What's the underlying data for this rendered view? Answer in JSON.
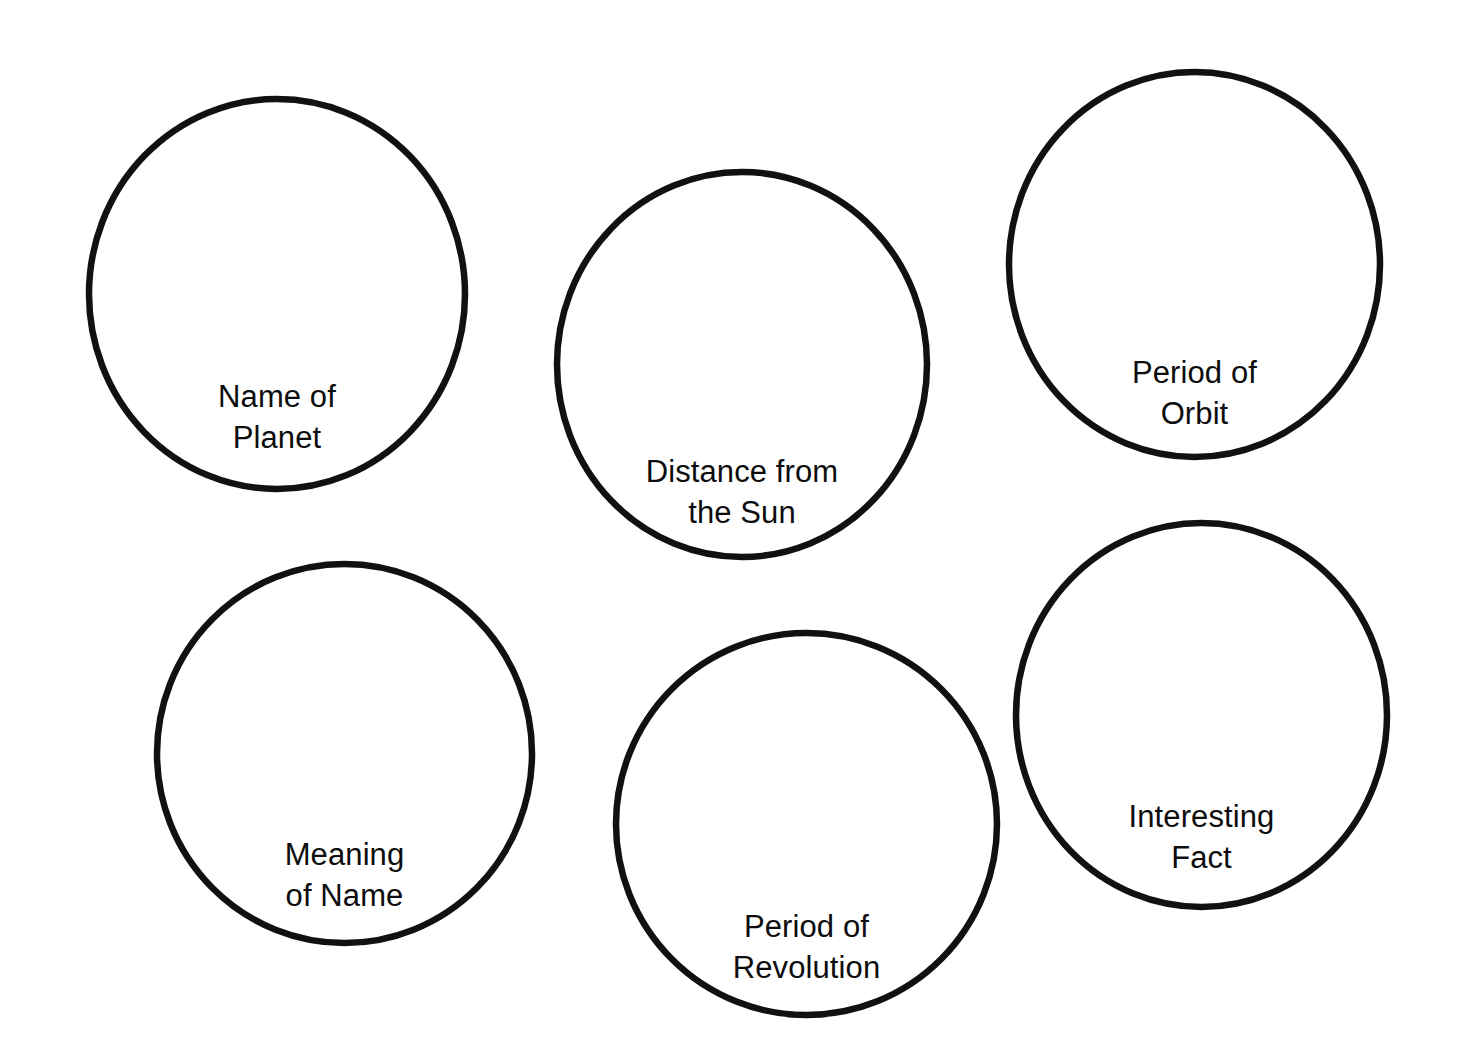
{
  "page": {
    "background_color": "#ffffff",
    "stroke_color": "#111111",
    "text_color": "#0d0d0d",
    "width": 1464,
    "height": 1061
  },
  "bubbles": [
    {
      "id": "name-of-planet",
      "label": "Name of\nPlanet",
      "line1": "Name of",
      "line2": "Planet"
    },
    {
      "id": "distance-from-the-sun",
      "label": "Distance from\nthe Sun",
      "line1": "Distance from",
      "line2": "the Sun"
    },
    {
      "id": "period-of-orbit",
      "label": "Period of\nOrbit",
      "line1": "Period of",
      "line2": "Orbit"
    },
    {
      "id": "meaning-of-name",
      "label": "Meaning\nof Name",
      "line1": "Meaning",
      "line2": "of Name"
    },
    {
      "id": "period-of-revolution",
      "label": "Period of\nRevolution",
      "line1": "Period of",
      "line2": "Revolution"
    },
    {
      "id": "interesting-fact",
      "label": "Interesting\nFact",
      "line1": "Interesting",
      "line2": "Fact"
    }
  ]
}
